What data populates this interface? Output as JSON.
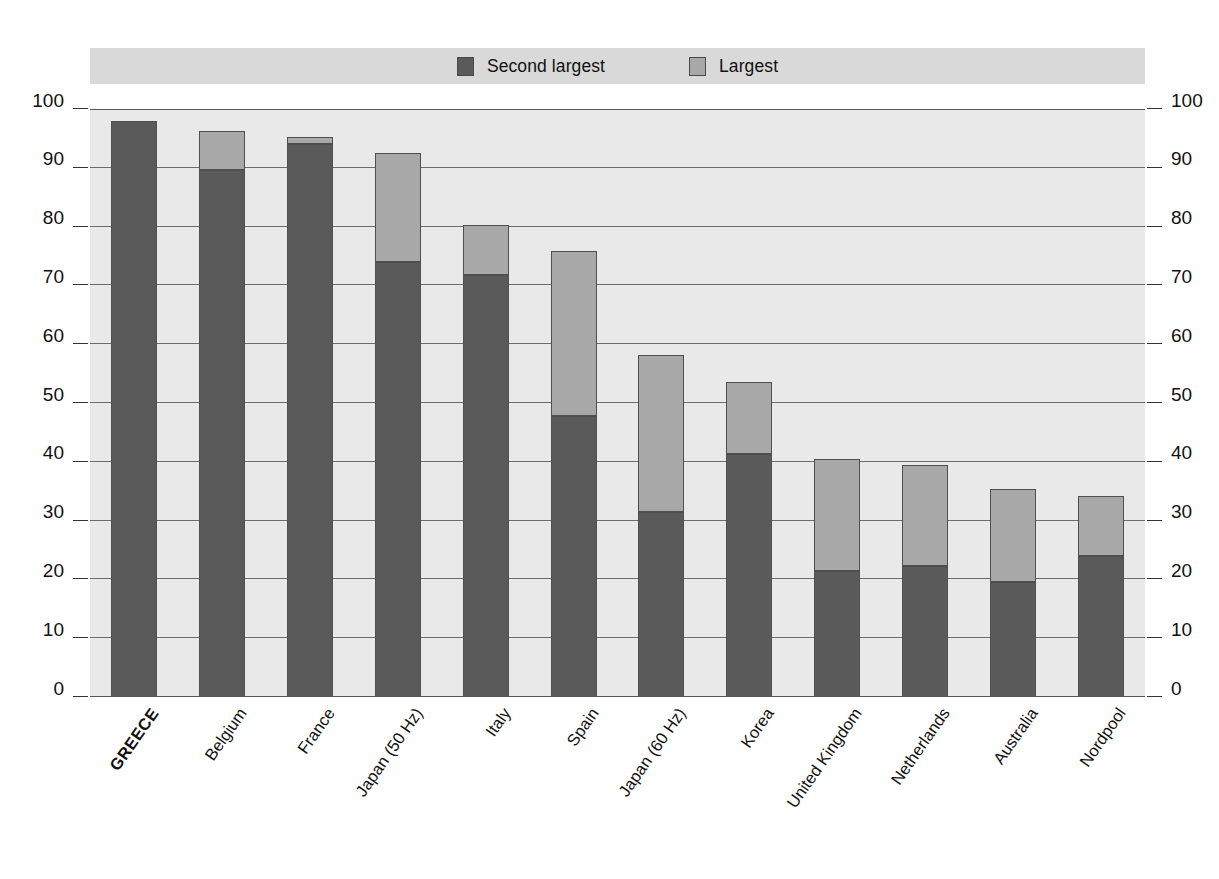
{
  "legend": {
    "items": [
      {
        "label": "Second largest",
        "color": "#5a5a5a",
        "name": "legend-second-largest"
      },
      {
        "label": "Largest",
        "color": "#a8a8a8",
        "name": "legend-largest"
      }
    ]
  },
  "axis": {
    "tick_labels": [
      "0",
      "10",
      "20",
      "30",
      "40",
      "50",
      "60",
      "70",
      "80",
      "90",
      "100"
    ]
  },
  "colors": {
    "second_largest": "#5a5a5a",
    "largest": "#a8a8a8",
    "plot_background": "#e9e9e9",
    "legend_background": "#d9d9d9",
    "gridline": "#6b6b6b",
    "text": "#111111"
  },
  "chart_data": {
    "type": "bar",
    "subtype": "stacked-vertical",
    "title": "",
    "xlabel": "",
    "ylabel": "",
    "ylim": [
      0,
      100
    ],
    "yticks": [
      0,
      10,
      20,
      30,
      40,
      50,
      60,
      70,
      80,
      90,
      100
    ],
    "grid": true,
    "legend_position": "top",
    "categories": [
      "GREECE",
      "Belgium",
      "France",
      "Japan (50 Hz)",
      "Italy",
      "Spain",
      "Japan (60 Hz)",
      "Korea",
      "United Kingdom",
      "Netherlands",
      "Australia",
      "Nordpool"
    ],
    "highlighted_category": "GREECE",
    "series": [
      {
        "name": "Second largest",
        "color": "#5a5a5a",
        "values": [
          98.0,
          89.7,
          94.1,
          74.0,
          71.7,
          47.8,
          31.5,
          41.4,
          21.5,
          22.3,
          19.5,
          23.9
        ]
      },
      {
        "name": "Largest",
        "color": "#a8a8a8",
        "values": [
          0.0,
          6.6,
          1.2,
          18.5,
          8.6,
          28.0,
          26.7,
          12.2,
          18.9,
          17.1,
          15.9,
          10.3
        ]
      }
    ],
    "totals": [
      98.0,
      96.3,
      95.3,
      92.5,
      80.3,
      75.8,
      58.2,
      53.6,
      40.4,
      39.4,
      35.4,
      34.2
    ]
  }
}
